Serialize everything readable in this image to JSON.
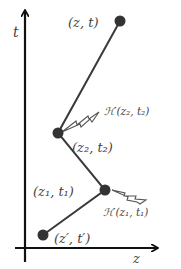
{
  "diagram": {
    "axes": {
      "vertical_label": "t",
      "horizontal_label": "z"
    },
    "points": [
      {
        "id": "end",
        "label": "(z, t)",
        "x": 120,
        "y": 21
      },
      {
        "id": "p2",
        "label": "(z₂, t₂)",
        "x": 58,
        "y": 133
      },
      {
        "id": "p1",
        "label": "(z₁, t₁)",
        "x": 105,
        "y": 190
      },
      {
        "id": "start",
        "label": "(z′, t′)",
        "x": 43,
        "y": 235
      }
    ],
    "kicks": [
      {
        "id": "kick2",
        "label": "ℋ′(z₂, t₂)"
      },
      {
        "id": "kick1",
        "label": "ℋ′(z₁, t₁)"
      }
    ],
    "colors": {
      "line": "#3a3a3a",
      "point": "#333333",
      "axis": "#111111",
      "text": "#444444"
    }
  }
}
